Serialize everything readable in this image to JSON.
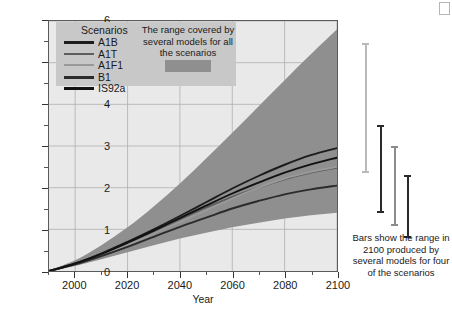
{
  "chart_data": {
    "type": "line",
    "title": "",
    "xlabel": "Year",
    "ylabel": "Temperature change (°C)",
    "xlim": [
      1990,
      2100
    ],
    "ylim": [
      0,
      6
    ],
    "xticks": [
      2000,
      2020,
      2040,
      2060,
      2080,
      2100
    ],
    "yticks": [
      0,
      1,
      2,
      3,
      4,
      5,
      6
    ],
    "grid": true,
    "legend_position": "upper-left",
    "x": [
      1990,
      2000,
      2010,
      2020,
      2030,
      2040,
      2050,
      2060,
      2070,
      2080,
      2090,
      2100
    ],
    "series": [
      {
        "name": "A1B",
        "color": "#1c1c1c",
        "values": [
          0.0,
          0.18,
          0.42,
          0.7,
          1.0,
          1.32,
          1.65,
          1.98,
          2.28,
          2.55,
          2.78,
          2.95
        ]
      },
      {
        "name": "A1T",
        "color": "#5e5e5e",
        "values": [
          0.0,
          0.17,
          0.4,
          0.66,
          0.95,
          1.24,
          1.52,
          1.78,
          2.0,
          2.2,
          2.36,
          2.48
        ]
      },
      {
        "name": "A1F1",
        "color": "#9a9a9a",
        "values": [
          0.0,
          0.16,
          0.38,
          0.63,
          0.9,
          1.18,
          1.46,
          1.74,
          2.0,
          2.22,
          2.38,
          2.5
        ]
      },
      {
        "name": "B1",
        "color": "#2b2b2b",
        "values": [
          0.0,
          0.16,
          0.36,
          0.58,
          0.82,
          1.06,
          1.28,
          1.5,
          1.68,
          1.84,
          1.96,
          2.05
        ]
      },
      {
        "name": "IS92a",
        "color": "#111111",
        "values": [
          0.0,
          0.18,
          0.41,
          0.68,
          0.97,
          1.27,
          1.57,
          1.86,
          2.12,
          2.36,
          2.56,
          2.72
        ]
      }
    ],
    "band": {
      "label": "The range covered by several models for all the scenarios",
      "color": "#8f8f8f",
      "upper": [
        0.02,
        0.26,
        0.62,
        1.05,
        1.55,
        2.1,
        2.7,
        3.32,
        3.95,
        4.58,
        5.2,
        5.8
      ],
      "lower": [
        0.0,
        0.12,
        0.28,
        0.45,
        0.62,
        0.78,
        0.92,
        1.05,
        1.16,
        1.26,
        1.34,
        1.4
      ]
    },
    "error_bars": {
      "note": "Bars show the range in 2100 produced by several models for four of the scenarios",
      "bars": [
        {
          "name": "bar-1",
          "color": "#b9b9b9",
          "low": 2.35,
          "high": 5.45
        },
        {
          "name": "bar-2",
          "color": "#2a2a2a",
          "low": 1.4,
          "high": 3.5
        },
        {
          "name": "bar-3",
          "color": "#8c8c8c",
          "low": 1.1,
          "high": 3.0
        },
        {
          "name": "bar-4",
          "color": "#2a2a2a",
          "low": 0.8,
          "high": 2.3
        }
      ]
    }
  },
  "legend": {
    "title": "Scenarios",
    "items": [
      {
        "label": "A1B",
        "color": "#1c1c1c",
        "thickness": 3
      },
      {
        "label": "A1T",
        "color": "#5e5e5e",
        "thickness": 2
      },
      {
        "label": "A1F1",
        "color": "#9a9a9a",
        "thickness": 2
      },
      {
        "label": "B1",
        "color": "#2b2b2b",
        "thickness": 3
      },
      {
        "label": "IS92a",
        "color": "#111111",
        "thickness": 3
      }
    ]
  },
  "annotations": {
    "range_note": "The range covered by several models for all the scenarios",
    "bars_note": "Bars show the range in 2100 produced by several models for four of the scenarios"
  },
  "colors": {
    "plot_background": "#e9e9e9",
    "band": "#8f8f8f",
    "legend_background": "#c8c8c8",
    "axis": "#333333",
    "grid": "#b0b0b0"
  }
}
